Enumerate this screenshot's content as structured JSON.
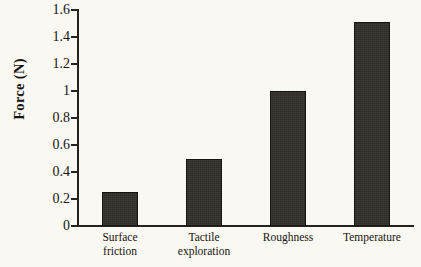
{
  "chart_data": {
    "type": "bar",
    "title": "",
    "xlabel": "",
    "ylabel": "Force (N)",
    "categories": [
      "Surface friction",
      "Tactile exploration",
      "Roughness",
      "Temperature"
    ],
    "category_lines": [
      [
        "Surface",
        "friction"
      ],
      [
        "Tactile",
        "exploration"
      ],
      [
        "Roughness"
      ],
      [
        "Temperature"
      ]
    ],
    "values": [
      0.25,
      0.5,
      1.0,
      1.51
    ],
    "ylim": [
      0,
      1.6
    ],
    "ytick_values": [
      0,
      0.2,
      0.4,
      0.6,
      0.8,
      1.0,
      1.2,
      1.4,
      1.6
    ],
    "ytick_labels": [
      "0",
      "0.2",
      "0.4",
      "0.6",
      "0.8",
      "1",
      "1.2",
      "1.4",
      "1.6"
    ],
    "grid": false,
    "legend": false,
    "bar_color": "#322d28",
    "axis_color": "#26231e",
    "background_color": "#faf8f2"
  }
}
